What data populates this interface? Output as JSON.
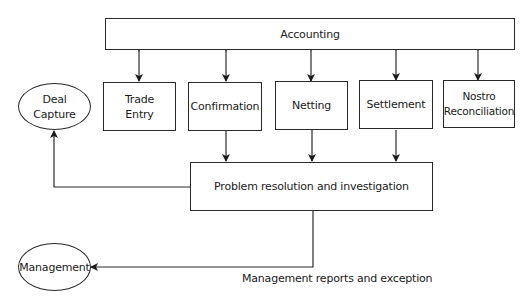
{
  "diagram": {
    "top_box": {
      "label": "Accounting"
    },
    "process_boxes": [
      {
        "label": "Trade\nEntry"
      },
      {
        "label": "Confirmation"
      },
      {
        "label": "Netting"
      },
      {
        "label": "Settlement"
      },
      {
        "label": "Nostro\nReconciliation"
      }
    ],
    "problem_box": {
      "label": "Problem resolution and investigation"
    },
    "external_entities": {
      "deal_capture": {
        "label": "Deal\nCapture"
      },
      "management": {
        "label": "Management"
      }
    },
    "edge_labels": {
      "management_reports": "Management reports and exception"
    },
    "edges": [
      {
        "from": "Accounting",
        "to": "Trade Entry",
        "type": "bidirectional"
      },
      {
        "from": "Accounting",
        "to": "Confirmation",
        "type": "bidirectional"
      },
      {
        "from": "Accounting",
        "to": "Netting",
        "type": "bidirectional"
      },
      {
        "from": "Accounting",
        "to": "Settlement",
        "type": "bidirectional"
      },
      {
        "from": "Accounting",
        "to": "Nostro Reconciliation",
        "type": "bidirectional"
      },
      {
        "from": "Confirmation",
        "to": "Problem resolution and investigation",
        "type": "directed"
      },
      {
        "from": "Netting",
        "to": "Problem resolution and investigation",
        "type": "directed"
      },
      {
        "from": "Settlement",
        "to": "Problem resolution and investigation",
        "type": "directed"
      },
      {
        "from": "Problem resolution and investigation",
        "to": "Deal Capture",
        "type": "directed"
      },
      {
        "from": "Problem resolution and investigation",
        "to": "Management",
        "type": "directed",
        "label": "Management reports and exception"
      }
    ]
  }
}
